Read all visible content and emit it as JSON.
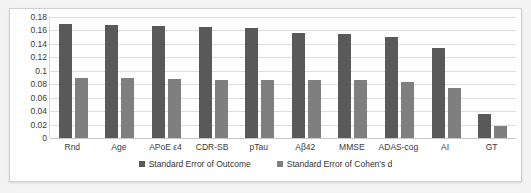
{
  "chart_data": {
    "type": "bar",
    "title": "",
    "xlabel": "",
    "ylabel": "",
    "ylim": [
      0,
      0.18
    ],
    "ytick_labels": [
      "0.18",
      "0.16",
      "0.14",
      "0.12",
      "0.1",
      "0.08",
      "0.06",
      "0.04",
      "0.02",
      "0"
    ],
    "ytick_values": [
      0.18,
      0.16,
      0.14,
      0.12,
      0.1,
      0.08,
      0.06,
      0.04,
      0.02,
      0
    ],
    "grid": true,
    "legend_position": "bottom",
    "categories": [
      "Rnd",
      "Age",
      "APoE ε4",
      "CDR-SB",
      "pTau",
      "Aβ42",
      "MMSE",
      "ADAS-cog",
      "AI",
      "GT"
    ],
    "series": [
      {
        "name": "Standard Error of Outcome",
        "color": "#595959",
        "values": [
          0.17,
          0.168,
          0.166,
          0.165,
          0.163,
          0.156,
          0.155,
          0.15,
          0.134,
          0.035
        ]
      },
      {
        "name": "Standard Error of Cohen's d",
        "color": "#7f7f7f",
        "values": [
          0.09,
          0.089,
          0.088,
          0.086,
          0.086,
          0.086,
          0.086,
          0.084,
          0.074,
          0.018
        ]
      }
    ]
  },
  "legend": {
    "items": [
      {
        "label": "Standard Error of Outcome",
        "color": "#595959"
      },
      {
        "label": "Standard Error of Cohen's d",
        "color": "#7f7f7f"
      }
    ]
  },
  "colors": {
    "outcome": "#595959",
    "cohen": "#7f7f7f",
    "gridline": "#dedede",
    "background": "#ffffff",
    "page": "#f3f3f3"
  }
}
